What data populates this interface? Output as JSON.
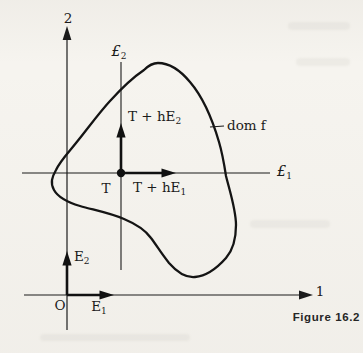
{
  "figure": {
    "caption": "Figure 16.2",
    "axes": {
      "axis2_label": "2",
      "axis1_label": "1",
      "origin_label": "O"
    },
    "lines": {
      "l1": {
        "base": "£",
        "sub": "1"
      },
      "l2": {
        "base": "£",
        "sub": "2"
      }
    },
    "points": {
      "t_label": "T"
    },
    "vectors": {
      "e1": {
        "base": "E",
        "sub": "1"
      },
      "e2": {
        "base": "E",
        "sub": "2"
      },
      "t_he1": {
        "base": "T + hE",
        "sub": "1"
      },
      "t_he2": {
        "base": "T + hE",
        "sub": "2"
      }
    },
    "domain_label": "dom f",
    "colors": {
      "ink": "#1b1b1b",
      "paper": "#f6f4ef"
    }
  }
}
